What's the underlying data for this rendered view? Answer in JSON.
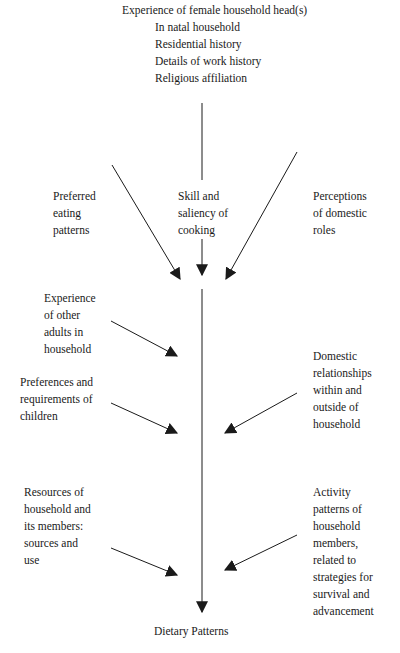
{
  "diagram": {
    "top": {
      "title": "Experience of female household head(s)",
      "items": [
        "In natal household",
        "Residential history",
        "Details of work history",
        "Religious affiliation"
      ]
    },
    "inputs": {
      "preferred_eating": [
        "Preferred",
        "eating",
        "patterns"
      ],
      "skill_cooking": [
        "Skill and",
        "saliency of",
        "cooking"
      ],
      "perceptions_roles": [
        "Perceptions",
        "of domestic",
        "roles"
      ],
      "other_adults": [
        "Experience",
        "of other",
        "adults in",
        "household"
      ],
      "children": [
        "Preferences and",
        "requirements of",
        "children"
      ],
      "domestic_relationships": [
        "Domestic",
        "relationships",
        "within and",
        "outside of",
        "household"
      ],
      "resources": [
        "Resources of",
        "household and",
        "its members:",
        "sources and",
        "use"
      ],
      "activity_patterns": [
        "Activity",
        "patterns of",
        "household",
        "members,",
        "related to",
        "strategies for",
        "survival and",
        "advancement"
      ]
    },
    "output": "Dietary Patterns",
    "colors": {
      "line": "#1a1a1a",
      "background": "#ffffff"
    }
  }
}
